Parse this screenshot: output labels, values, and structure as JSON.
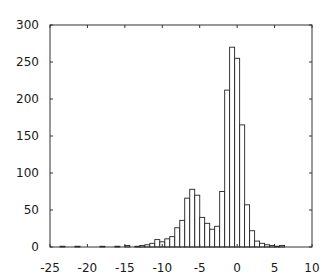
{
  "chart_data": {
    "type": "bar",
    "subtype": "histogram",
    "title": "",
    "xlabel": "",
    "ylabel": "",
    "xlim": [
      -25,
      10
    ],
    "ylim": [
      0,
      300
    ],
    "x_ticks": [
      -25,
      -20,
      -15,
      -10,
      -5,
      0,
      5,
      10
    ],
    "y_ticks": [
      0,
      50,
      100,
      150,
      200,
      250,
      300
    ],
    "grid": false,
    "legend": null,
    "bin_width": 0.667,
    "bin_centers": [
      -23.33,
      -21.33,
      -18.0,
      -16.0,
      -14.67,
      -13.33,
      -12.67,
      -12.0,
      -11.33,
      -10.67,
      -10.0,
      -9.33,
      -8.67,
      -8.0,
      -7.33,
      -6.67,
      -6.0,
      -5.33,
      -4.67,
      -4.0,
      -3.33,
      -2.67,
      -2.0,
      -1.33,
      -0.67,
      0.0,
      0.67,
      1.33,
      2.0,
      2.67,
      3.33,
      4.0,
      4.67,
      5.33,
      6.0
    ],
    "values": [
      1,
      1,
      1,
      1,
      2,
      1,
      2,
      3,
      5,
      10,
      7,
      11,
      14,
      26,
      36,
      66,
      78,
      70,
      40,
      32,
      24,
      28,
      75,
      212,
      270,
      255,
      165,
      57,
      22,
      8,
      5,
      3,
      2,
      1,
      2
    ],
    "colors": {
      "bar_fill": "#ffffff",
      "bar_edge": "#222222",
      "axis": "#333333"
    }
  }
}
